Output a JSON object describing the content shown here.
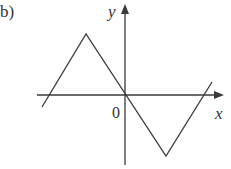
{
  "figure": {
    "label": "b)",
    "axis_x_label": "x",
    "axis_y_label": "y",
    "origin_label": "0"
  },
  "colors": {
    "stroke": "#3a3a3a",
    "background": "#ffffff"
  },
  "graph": {
    "description": "Piecewise linear function: rises to a peak left of the y-axis, falls through the origin to a trough right of the y-axis, then rises again",
    "vertices_px": [
      [
        42,
        107
      ],
      [
        86,
        34
      ],
      [
        166,
        156
      ],
      [
        212,
        82
      ]
    ]
  }
}
